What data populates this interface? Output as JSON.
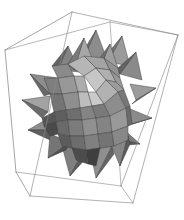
{
  "figure": {
    "title": "Stellated polyhedron in bounding box",
    "kind": "3d-polyhedron-render",
    "width": 184,
    "height": 220,
    "background_color": "#ffffff",
    "renderer_style": "flat-shaded-grayscale",
    "wireframe": {
      "name": "bounding-box",
      "stroke_color": "#9a9a9a",
      "stroke_width": 0.7,
      "shape": "cuboid",
      "vertices": {
        "back_top_left": [
          5,
          50
        ],
        "back_top_right": [
          110,
          22
        ],
        "front_top_left": [
          72,
          12
        ],
        "front_top_right": [
          178,
          35
        ],
        "back_bottom_left": [
          16,
          172
        ],
        "back_bottom_right": [
          121,
          186
        ],
        "front_bottom_left": [
          30,
          196
        ],
        "front_bottom_right": [
          133,
          203
        ]
      },
      "edges": [
        [
          "back_top_left",
          "front_top_left"
        ],
        [
          "front_top_left",
          "front_top_right"
        ],
        [
          "front_top_right",
          "back_top_right"
        ],
        [
          "back_top_right",
          "back_top_left"
        ],
        [
          "back_bottom_left",
          "front_bottom_left"
        ],
        [
          "front_bottom_left",
          "front_bottom_right"
        ],
        [
          "front_bottom_right",
          "back_bottom_right"
        ],
        [
          "back_bottom_right",
          "back_bottom_left"
        ],
        [
          "back_top_left",
          "back_bottom_left"
        ],
        [
          "front_top_left",
          "front_bottom_left"
        ],
        [
          "front_top_right",
          "front_bottom_right"
        ],
        [
          "back_top_right",
          "back_bottom_right"
        ]
      ]
    },
    "solid": {
      "name": "stellated-polyhedron",
      "center": [
        84,
        104
      ],
      "spike_count": 20,
      "palette": {
        "highlight": "#cccccc",
        "light": "#b4b4b4",
        "mid_light": "#a0a0a0",
        "mid": "#8c8c8c",
        "mid_dark": "#787878",
        "dark": "#5e5e5e",
        "darkest": "#464646",
        "edge": "#3c3c3c"
      }
    }
  }
}
